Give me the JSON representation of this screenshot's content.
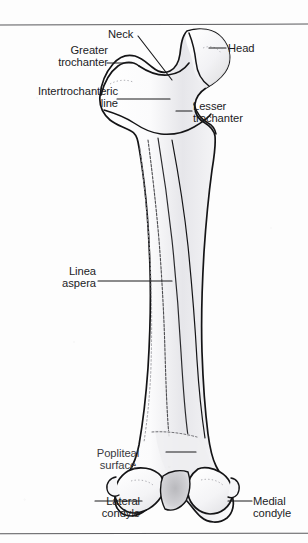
{
  "figure": {
    "view": "posterior",
    "line_color": "#141416",
    "fill_color": "#fdfdfd",
    "shade_color": "#d8d8dc",
    "rule_color": "#59595c",
    "background": "#fdfdfd"
  },
  "rules": {
    "top_label": "horizontal-rule-top",
    "bottom_label": "horizontal-rule-bottom"
  },
  "labels": {
    "greater_trochanter": "Greater\ntrochanter",
    "intertrochanteric_line": "Intertrochanteric\nline",
    "neck": "Neck",
    "head": "Head",
    "lesser_trochanter": "Lesser\ntrochanter",
    "linea_aspera": "Linea\naspera",
    "popliteal_surface": "Popliteal\nsurface",
    "lateral_condyle": "Lateral\ncondyle",
    "medial_condyle": "Medial\ncondyle"
  }
}
